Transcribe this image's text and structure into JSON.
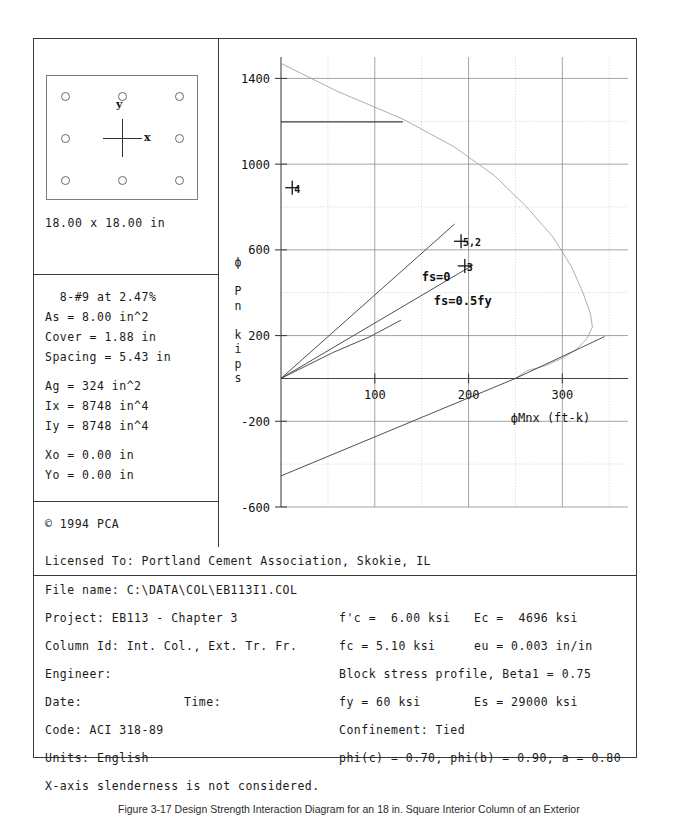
{
  "section": {
    "title_dimension": "18.00 x 18.00 in",
    "axis_y_label": "y",
    "axis_x_label": "x",
    "bar_count": 8
  },
  "properties": [
    "  8-#9 at 2.47%",
    "As = 8.00 in^2",
    "Cover = 1.88 in",
    "Spacing = 5.43 in",
    "",
    "Ag = 324 in^2",
    "Ix = 8748 in^4",
    "Iy = 8748 in^4",
    "",
    "Xo = 0.00 in",
    "Yo = 0.00 in"
  ],
  "copyright": "© 1994 PCA",
  "license": {
    "label": "Licensed To: Portland Cement Association, Skokie, IL"
  },
  "info_rows": [
    {
      "c1": "File name: C:\\DATA\\COL\\EB113I1.COL",
      "c1b": "",
      "c2": "",
      "c3": ""
    },
    {
      "c1": "Project: EB113 - Chapter 3",
      "c1b": "",
      "c2": "f'c =  6.00 ksi",
      "c3": "Ec =  4696 ksi"
    },
    {
      "c1": "Column Id: Int. Col., Ext. Tr. Fr.",
      "c1b": "",
      "c2": "fc = 5.10 ksi",
      "c3": "eu = 0.003 in/in"
    },
    {
      "c1": "Engineer:",
      "c1b": "",
      "c2": "Block stress profile, Beta1 = 0.75",
      "c3": ""
    },
    {
      "c1": "Date:",
      "c1b": "Time:",
      "c2": "fy = 60 ksi",
      "c3": "Es = 29000 ksi"
    },
    {
      "c1": "Code: ACI 318-89",
      "c1b": "",
      "c2": "Confinement: Tied",
      "c3": ""
    },
    {
      "c1": "Units: English",
      "c1b": "",
      "c2": "phi(c) = 0.70, phi(b) = 0.90, a = 0.80",
      "c3": ""
    },
    {
      "c1": "X-axis slenderness is not considered.",
      "c1b": "",
      "c2": "",
      "c3": ""
    }
  ],
  "caption": "Figure 3-17 Design Strength Interaction Diagram for an 18 in. Square Interior Column of an Exterior",
  "chart_data": {
    "type": "line",
    "title": "",
    "xlabel": "фMnx (ft-k)",
    "ylabel": "ф P n k i p s",
    "ylabel_chars": [
      "ф",
      "",
      "P",
      "n",
      "",
      "k",
      "i",
      "p",
      "s"
    ],
    "xlim": [
      0,
      370
    ],
    "ylim": [
      -600,
      1500
    ],
    "xticks": [
      100,
      200,
      300
    ],
    "yticks": [
      1400,
      1000,
      600,
      200,
      -200,
      -600
    ],
    "xminor_step": 50,
    "yminor_step": 200,
    "grid": true,
    "annotations": [
      {
        "text": "fs=0",
        "x": 150,
        "y": 455
      },
      {
        "text": "fs=0.5fy",
        "x": 163,
        "y": 345
      }
    ],
    "point_markers": [
      {
        "label": "4",
        "x": 12,
        "y": 890
      },
      {
        "label": "5,2",
        "x": 192,
        "y": 640
      },
      {
        "label": "3",
        "x": 196,
        "y": 525
      }
    ],
    "series": [
      {
        "name": "nominal-capacity",
        "points": [
          [
            0,
            1470
          ],
          [
            60,
            1340
          ],
          [
            130,
            1210
          ],
          [
            185,
            1080
          ],
          [
            228,
            945
          ],
          [
            262,
            800
          ],
          [
            290,
            660
          ],
          [
            310,
            520
          ],
          [
            322,
            400
          ],
          [
            330,
            300
          ],
          [
            332,
            240
          ],
          [
            326,
            185
          ],
          [
            315,
            135
          ],
          [
            300,
            95
          ],
          [
            282,
            60
          ],
          [
            262,
            35
          ],
          [
            250,
            0
          ]
        ]
      },
      {
        "name": "design-capacity-cutoff",
        "points": [
          [
            0,
            1197
          ],
          [
            130,
            1197
          ]
        ]
      },
      {
        "name": "fs-equals-0-line",
        "points": [
          [
            0,
            0
          ],
          [
            185,
            720
          ]
        ]
      },
      {
        "name": "fs-equals-half-fy-line",
        "points": [
          [
            0,
            0
          ],
          [
            205,
            530
          ]
        ]
      },
      {
        "name": "lower-tension-branch",
        "points": [
          [
            0,
            -455
          ],
          [
            250,
            0
          ],
          [
            345,
            195
          ]
        ]
      },
      {
        "name": "left-lower-curve",
        "points": [
          [
            0,
            0
          ],
          [
            55,
            120
          ],
          [
            95,
            195
          ],
          [
            128,
            272
          ]
        ]
      }
    ]
  }
}
